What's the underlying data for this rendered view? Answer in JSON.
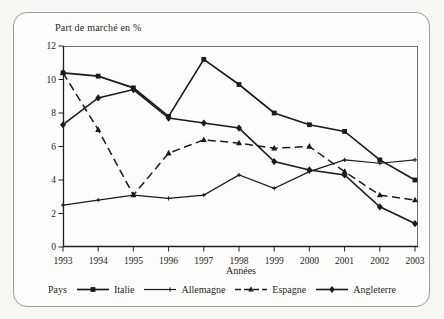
{
  "chart_data": {
    "type": "line",
    "title": "Part de marché en %",
    "xlabel": "Années",
    "legend_title": "Pays",
    "legend_position": "bottom",
    "grid": false,
    "x": [
      1993,
      1994,
      1995,
      1996,
      1997,
      1998,
      1999,
      2000,
      2001,
      2002,
      2003
    ],
    "ylim": [
      0,
      12
    ],
    "yticks": [
      0,
      2,
      4,
      6,
      8,
      10,
      12
    ],
    "line_color": "#1b1b1b",
    "frame_color": "#9c9c99",
    "series": [
      {
        "name": "Italie",
        "marker": "square",
        "line": "solid",
        "values": [
          10.4,
          10.2,
          9.5,
          7.8,
          11.2,
          9.7,
          8.0,
          7.3,
          6.9,
          5.2,
          4.0
        ]
      },
      {
        "name": "Allemagne",
        "marker": "tick",
        "line": "solid",
        "values": [
          2.5,
          2.8,
          3.1,
          2.9,
          3.1,
          4.3,
          3.5,
          4.5,
          5.2,
          5.0,
          5.2
        ]
      },
      {
        "name": "Espagne",
        "marker": "triangle",
        "line": "dashed",
        "values": [
          10.4,
          7.0,
          3.1,
          5.6,
          6.4,
          6.2,
          5.9,
          6.0,
          4.5,
          3.1,
          2.8
        ]
      },
      {
        "name": "Angleterre",
        "marker": "diamond",
        "line": "solid",
        "values": [
          7.3,
          8.9,
          9.4,
          7.7,
          7.4,
          7.1,
          5.1,
          4.6,
          4.3,
          2.4,
          1.4
        ]
      }
    ]
  }
}
